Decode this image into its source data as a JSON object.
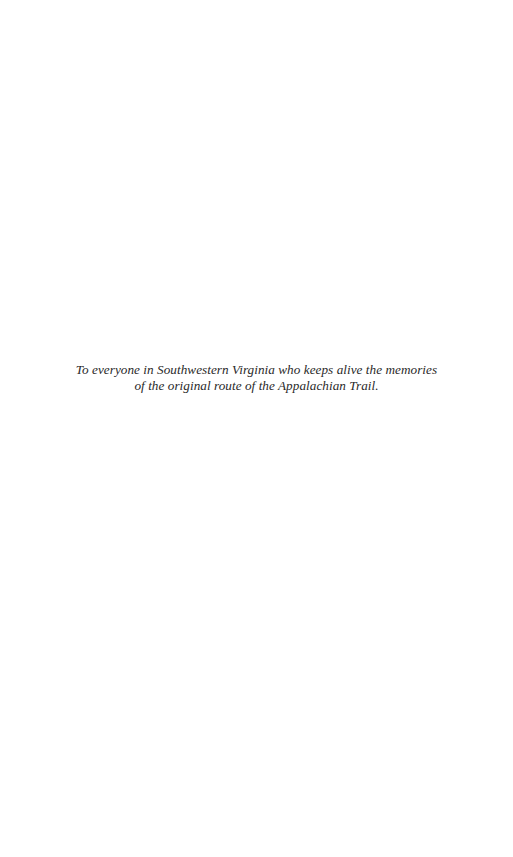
{
  "page": {
    "type": "dedication",
    "background": "#ffffff",
    "text_color": "#2a2a2a"
  },
  "dedication": {
    "lines": [
      "To everyone in Southwestern Virginia who keeps alive the memories",
      "of  the original route of  the Appalachian Trail."
    ]
  }
}
